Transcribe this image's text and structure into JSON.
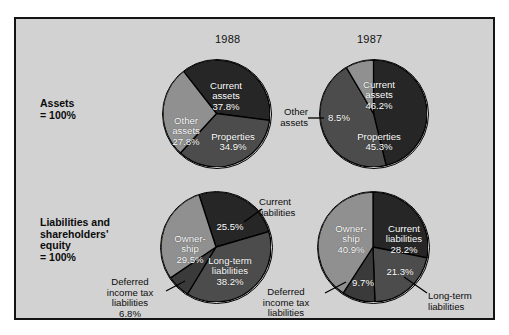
{
  "figure": {
    "background": "#d2d2d2",
    "border_color": "#141414",
    "years": [
      {
        "label": "1988"
      },
      {
        "label": "1987"
      }
    ],
    "row_labels": [
      {
        "text": "Assets\n= 100%"
      },
      {
        "text": "Liabilities and\nshareholders'\nequity\n= 100%"
      }
    ]
  },
  "palette": {
    "dark": "#262626",
    "medium": "#4c4c4c",
    "mid_dark": "#3a3a3a",
    "light": "#909090",
    "outline": "#000000",
    "label_text": "#ffffff"
  },
  "chart_data": [
    {
      "type": "pie",
      "title": "1988",
      "group": "Assets = 100%",
      "categories": [
        "Current assets",
        "Properties",
        "Other assets"
      ],
      "values": [
        37.8,
        34.9,
        27.8
      ],
      "value_labels": [
        "37.8%",
        "34.9%",
        "27.8%"
      ],
      "colors": [
        "#262626",
        "#4c4c4c",
        "#909090"
      ],
      "start_angle_deg": -38,
      "labels_inside": [
        {
          "text": "Current\nassets\n37.8%"
        },
        {
          "text": "Properties\n34.9%"
        },
        {
          "text": "Other\nassets\n27.8%"
        }
      ],
      "callouts": []
    },
    {
      "type": "pie",
      "title": "1987",
      "group": "Assets = 100%",
      "categories": [
        "Current assets",
        "Properties",
        "Other assets"
      ],
      "values": [
        46.2,
        45.3,
        8.5
      ],
      "value_labels": [
        "46.2%",
        "45.3%",
        "8.5%"
      ],
      "colors": [
        "#262626",
        "#4c4c4c",
        "#909090"
      ],
      "start_angle_deg": 0,
      "labels_inside": [
        {
          "text": "Current\nassets\n46.2%"
        },
        {
          "text": "Properties\n45.3%"
        },
        {
          "text": "8.5%"
        }
      ],
      "callouts": [
        {
          "text": "Other\nassets"
        }
      ]
    },
    {
      "type": "pie",
      "title": "1988",
      "group": "Liabilities and shareholders' equity = 100%",
      "categories": [
        "Current liabilities",
        "Long-term liabilities",
        "Deferred income tax liabilities",
        "Ownership"
      ],
      "values": [
        25.5,
        38.2,
        6.8,
        29.5
      ],
      "value_labels": [
        "25.5%",
        "38.2%",
        "6.8%",
        "29.5%"
      ],
      "colors": [
        "#262626",
        "#4c4c4c",
        "#3a3a3a",
        "#909090"
      ],
      "start_angle_deg": -18,
      "labels_inside": [
        {
          "text": "25.5%"
        },
        {
          "text": "Long-term\nliabilities\n38.2%"
        },
        {
          "text": "Owner-\nship\n29.5%"
        }
      ],
      "callouts": [
        {
          "text": "Current\nliabilities"
        },
        {
          "text": "Deferred\nincome tax\nliabilities\n6.8%"
        }
      ]
    },
    {
      "type": "pie",
      "title": "1987",
      "group": "Liabilities and shareholders' equity = 100%",
      "categories": [
        "Current liabilities",
        "Long-term liabilities",
        "Deferred income tax liabilities",
        "Ownership"
      ],
      "values": [
        28.2,
        21.3,
        9.7,
        40.9
      ],
      "value_labels": [
        "28.2%",
        "21.3%",
        "9.7%",
        "40.9%"
      ],
      "colors": [
        "#262626",
        "#4c4c4c",
        "#3a3a3a",
        "#909090"
      ],
      "start_angle_deg": 0,
      "labels_inside": [
        {
          "text": "Current\nliabilities\n28.2%"
        },
        {
          "text": "21.3%"
        },
        {
          "text": "9.7%"
        },
        {
          "text": "Owner-\nship\n40.9%"
        }
      ],
      "callouts": [
        {
          "text": "Deferred\nincome tax\nliabilities"
        },
        {
          "text": "Long-term\nliabilities"
        }
      ]
    }
  ]
}
